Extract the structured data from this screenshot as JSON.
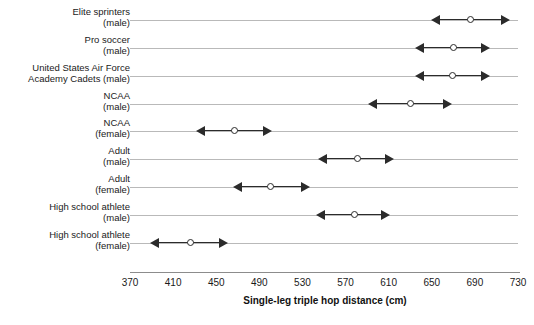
{
  "chart_data": {
    "type": "scatter",
    "title": "",
    "xlabel": "Single-leg triple hop distance (cm)",
    "ylabel": "",
    "xlim": [
      370,
      730
    ],
    "xticks": [
      370,
      410,
      450,
      490,
      530,
      570,
      610,
      650,
      690,
      730
    ],
    "grid": true,
    "legend": "none",
    "marker_style": "open-circle-with-double-headed-arrow",
    "categories": [
      "Elite sprinters\n(male)",
      "Pro soccer\n(male)",
      "United States Air Force\nAcademy Cadets (male)",
      "NCAA\n(male)",
      "NCAA\n(female)",
      "Adult\n(male)",
      "Adult\n(female)",
      "High school athlete\n(male)",
      "High school athlete\n(female)"
    ],
    "points": [
      {
        "category": "Elite sprinters (male)",
        "low": 649,
        "value": 686,
        "high": 723
      },
      {
        "category": "Pro soccer (male)",
        "low": 634,
        "value": 670,
        "high": 704
      },
      {
        "category": "United States Air Force Academy Cadets (male)",
        "low": 634,
        "value": 669,
        "high": 704
      },
      {
        "category": "NCAA (male)",
        "low": 591,
        "value": 630,
        "high": 669
      },
      {
        "category": "NCAA (female)",
        "low": 431,
        "value": 467,
        "high": 502
      },
      {
        "category": "Adult (male)",
        "low": 544,
        "value": 581,
        "high": 615
      },
      {
        "category": "Adult (female)",
        "low": 466,
        "value": 500,
        "high": 537
      },
      {
        "category": "High school athlete (male)",
        "low": 543,
        "value": 578,
        "high": 611
      },
      {
        "category": "High school athlete (female)",
        "low": 389,
        "value": 426,
        "high": 461
      }
    ],
    "colors": {
      "marker": "#2b2b2b",
      "gridline": "#b9b9b9",
      "axis": "#8c8c8c",
      "text": "#1a1a1a",
      "background": "#ffffff"
    }
  }
}
